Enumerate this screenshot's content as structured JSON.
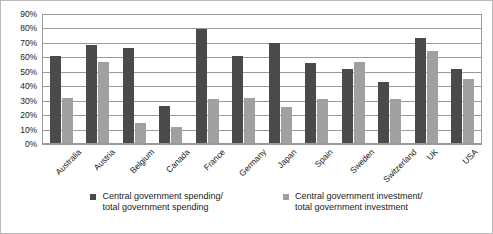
{
  "chart_data": {
    "type": "bar",
    "title": "",
    "subtitle": "",
    "xlabel": "",
    "ylabel": "",
    "ylim": [
      0,
      90
    ],
    "ytick_values": [
      0,
      10,
      20,
      30,
      40,
      50,
      60,
      70,
      80,
      90
    ],
    "ytick_labels": [
      "0%",
      "10%",
      "20%",
      "30%",
      "40%",
      "50%",
      "60%",
      "70%",
      "80%",
      "90%"
    ],
    "grid": "horizontal",
    "legend_position": "bottom",
    "categories": [
      "Australia",
      "Austria",
      "Belgium",
      "Canada",
      "France",
      "Germany",
      "Japan",
      "Spain",
      "Sweden",
      "Switzerland",
      "UK",
      "USA"
    ],
    "series": [
      {
        "name": "Central government spending/\ntotal government spending",
        "color": "#4a4a4a",
        "values": [
          61,
          69,
          67,
          26,
          80,
          61,
          70,
          56,
          52,
          43,
          74,
          52
        ]
      },
      {
        "name": "Central government investment/\ntotal government investment",
        "color": "#a0a0a0",
        "values": [
          32,
          57,
          14,
          11,
          31,
          32,
          25,
          31,
          57,
          31,
          65,
          45
        ]
      }
    ]
  }
}
